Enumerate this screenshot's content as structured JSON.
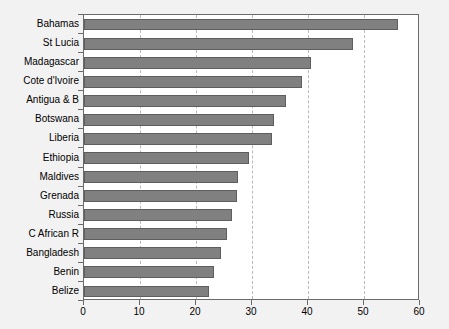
{
  "chart_data": {
    "type": "bar",
    "orientation": "horizontal",
    "title": "",
    "xlabel": "",
    "ylabel": "",
    "xlim": [
      0,
      60
    ],
    "ylim": null,
    "grid": true,
    "grid_axis": "x",
    "legend": null,
    "bar_color": "#808080",
    "bar_edge_color": "#5e5e5e",
    "plot_background": "#ffffff",
    "figure_background": "#f2f2f2",
    "axis_color": "#6b6b6b",
    "gridline_color": "#b9b9b9",
    "gridline_style": "dashed",
    "xticks": [
      0,
      10,
      20,
      30,
      40,
      50,
      60
    ],
    "xticklabels": [
      "0",
      "10",
      "20",
      "30",
      "40",
      "50",
      "60"
    ],
    "categories": [
      "Bahamas",
      "St Lucia",
      "Madagascar",
      "Cote d'Ivoire",
      "Antigua & B",
      "Botswana",
      "Liberia",
      "Ethiopia",
      "Maldives",
      "Grenada",
      "Russia",
      "C African R",
      "Bangladesh",
      "Benin",
      "Belize"
    ],
    "values": [
      56.0,
      48.0,
      40.5,
      39.0,
      36.0,
      34.0,
      33.5,
      29.5,
      27.5,
      27.3,
      26.5,
      25.5,
      24.5,
      23.3,
      22.3
    ]
  }
}
